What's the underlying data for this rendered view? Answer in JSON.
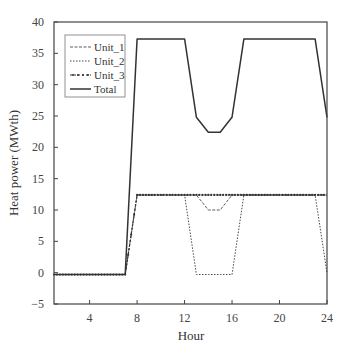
{
  "chart_data": {
    "type": "line",
    "title": "",
    "xlabel": "Hour",
    "ylabel": "Heat power (MWth)",
    "xlim": [
      1,
      24
    ],
    "ylim": [
      -5,
      40
    ],
    "xticks": [
      4,
      8,
      12,
      16,
      20,
      24
    ],
    "yticks": [
      -5,
      0,
      5,
      10,
      15,
      20,
      25,
      30,
      35,
      40
    ],
    "grid": false,
    "legend_position": "upper left",
    "x": [
      1,
      2,
      3,
      4,
      5,
      6,
      7,
      8,
      9,
      10,
      11,
      12,
      13,
      14,
      15,
      16,
      17,
      18,
      19,
      20,
      21,
      22,
      23,
      24
    ],
    "series": [
      {
        "name": "Unit_1",
        "style": "dash-dot thin",
        "values": [
          -0.3,
          -0.3,
          -0.3,
          -0.3,
          -0.3,
          -0.3,
          -0.3,
          12.4,
          12.4,
          12.4,
          12.4,
          12.4,
          12.4,
          10,
          10,
          12.4,
          12.4,
          12.4,
          12.4,
          12.4,
          12.4,
          12.4,
          12.4,
          12.4
        ]
      },
      {
        "name": "Unit_2",
        "style": "dotted",
        "values": [
          -0.3,
          -0.3,
          -0.3,
          -0.3,
          -0.3,
          -0.3,
          -0.3,
          12.4,
          12.4,
          12.4,
          12.4,
          12.4,
          -0.3,
          -0.3,
          -0.3,
          -0.3,
          12.4,
          12.4,
          12.4,
          12.4,
          12.4,
          12.4,
          12.4,
          0
        ]
      },
      {
        "name": "Unit_3",
        "style": "dashed with star markers",
        "values": [
          -0.3,
          -0.3,
          -0.3,
          -0.3,
          -0.3,
          -0.3,
          -0.3,
          12.4,
          12.4,
          12.4,
          12.4,
          12.4,
          12.4,
          12.4,
          12.4,
          12.4,
          12.4,
          12.4,
          12.4,
          12.4,
          12.4,
          12.4,
          12.4,
          12.4
        ]
      },
      {
        "name": "Total",
        "style": "solid",
        "values": [
          -0.3,
          -0.3,
          -0.3,
          -0.3,
          -0.3,
          -0.3,
          -0.3,
          37.3,
          37.3,
          37.3,
          37.3,
          37.3,
          24.8,
          22.4,
          22.4,
          24.8,
          37.3,
          37.3,
          37.3,
          37.3,
          37.3,
          37.3,
          37.3,
          24.8
        ]
      }
    ]
  },
  "colors": {
    "axis": "#444444",
    "series": "#333333"
  }
}
